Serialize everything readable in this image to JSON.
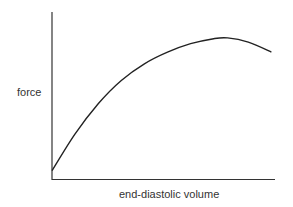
{
  "chart_data": {
    "type": "line",
    "title": "",
    "xlabel": "end-diastolic volume",
    "ylabel": "force",
    "grid": false,
    "legend": null,
    "x_ticks": [],
    "y_ticks": [],
    "series": [
      {
        "name": "force vs end-diastolic volume",
        "x": [
          0,
          0.1,
          0.2,
          0.3,
          0.4,
          0.5,
          0.6,
          0.7,
          0.76,
          0.85,
          0.95
        ],
        "y": [
          0.05,
          0.27,
          0.45,
          0.59,
          0.69,
          0.76,
          0.81,
          0.84,
          0.845,
          0.82,
          0.76
        ]
      }
    ],
    "xlim": [
      0,
      1
    ],
    "ylim": [
      0,
      1
    ]
  },
  "labels": {
    "y_axis": "force",
    "x_axis": "end-diastolic volume"
  }
}
